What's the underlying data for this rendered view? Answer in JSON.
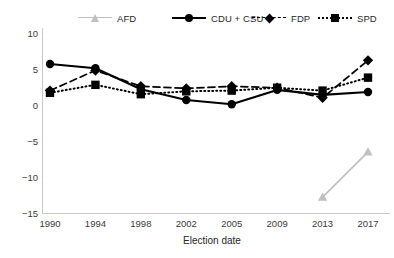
{
  "chart_data": {
    "type": "line",
    "title": "",
    "xlabel": "Election date",
    "ylabel": "",
    "categories": [
      "1990",
      "1994",
      "1998",
      "2002",
      "2005",
      "2009",
      "2013",
      "2017"
    ],
    "x": [
      1990,
      1994,
      1998,
      2002,
      2005,
      2009,
      2013,
      2017
    ],
    "ylim": [
      -15,
      10
    ],
    "yticks": [
      "10",
      "5",
      "0",
      "−5",
      "−10",
      "−15"
    ],
    "ytick_values": [
      10,
      5,
      0,
      -5,
      -10,
      -15
    ],
    "grid": false,
    "legend_position": "top",
    "series": [
      {
        "name": "AFD",
        "color": "#bfbfbf",
        "marker": "triangle",
        "line_style": "solid",
        "values": [
          null,
          null,
          null,
          null,
          null,
          null,
          -12.8,
          -6.5
        ]
      },
      {
        "name": "CDU + CSU",
        "color": "#000000",
        "marker": "circle",
        "line_style": "solid",
        "values": [
          5.7,
          5.1,
          2.2,
          0.7,
          0.1,
          2.1,
          1.4,
          1.8
        ]
      },
      {
        "name": "FDP",
        "color": "#000000",
        "marker": "diamond",
        "line_style": "dashed",
        "values": [
          2.0,
          4.8,
          2.6,
          2.3,
          2.6,
          2.4,
          1.0,
          6.2
        ]
      },
      {
        "name": "SPD",
        "color": "#000000",
        "marker": "square",
        "line_style": "dotted",
        "values": [
          1.7,
          2.8,
          1.5,
          1.9,
          2.0,
          2.4,
          2.0,
          3.8
        ]
      }
    ]
  },
  "legend": {
    "items": [
      {
        "label": "AFD"
      },
      {
        "label": "CDU + CSU"
      },
      {
        "label": "FDP"
      },
      {
        "label": "SPD"
      }
    ]
  }
}
